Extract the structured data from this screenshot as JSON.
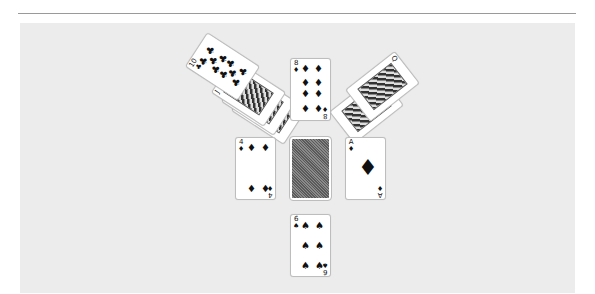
{
  "game": {
    "type": "solitaire",
    "background_color": "#ececec"
  },
  "piles": {
    "top_left_fan": {
      "cards": [
        {
          "rank": "J",
          "suit": "♣",
          "face_up": true
        },
        {
          "rank": "Q",
          "suit": "♣",
          "face_up": true
        },
        {
          "rank": "K",
          "suit": "♣",
          "face_up": true
        },
        {
          "rank": "10",
          "suit": "♣",
          "face_up": true
        }
      ]
    },
    "top_center": {
      "rank": "8",
      "suit": "♦",
      "face_up": true
    },
    "top_right_fan": {
      "cards": [
        {
          "rank": "K",
          "suit": "♠",
          "face_up": true
        },
        {
          "rank": "Q",
          "suit": "♦",
          "face_up": true
        }
      ]
    },
    "middle_left": {
      "rank": "4",
      "suit": "♦",
      "face_up": true
    },
    "stock": {
      "face_up": false,
      "label": "deck"
    },
    "middle_right": {
      "rank": "A",
      "suit": "♦",
      "face_up": true
    },
    "bottom_center": {
      "rank": "6",
      "suit": "♠",
      "face_up": true
    }
  }
}
